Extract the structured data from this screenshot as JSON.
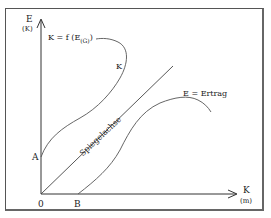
{
  "diagram": {
    "y_axis": {
      "label": "E",
      "unit": "(K)"
    },
    "x_axis": {
      "label": "K",
      "unit": "(m)"
    },
    "origin_label": "0",
    "point_a": "A",
    "point_b": "B",
    "curve_k": {
      "equation_prefix": "K = f (E",
      "equation_subscript": "(G)",
      "equation_suffix": ")",
      "label": "K"
    },
    "curve_e": {
      "label": "E = Ertrag"
    },
    "mirror_axis": {
      "label": "Spiegelachse"
    },
    "colors": {
      "line": "#333333",
      "curve": "#555555",
      "frame": "#555555"
    }
  }
}
